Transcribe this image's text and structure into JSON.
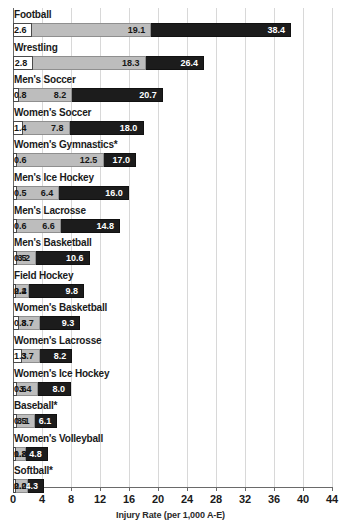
{
  "chart_data": {
    "type": "bar",
    "orientation": "horizontal",
    "title": "",
    "xlabel": "Injury Rate (per 1,000 A-E)",
    "ylabel": "",
    "xlim": [
      0,
      44
    ],
    "xticks": [
      0,
      4,
      8,
      12,
      16,
      20,
      24,
      28,
      32,
      36,
      40,
      44
    ],
    "grid": true,
    "legend": "none",
    "categories": [
      "Football",
      "Wrestling",
      "Men's Soccer",
      "Women's Soccer",
      "Women's Gymnastics*",
      "Men's Ice Hockey",
      "Men's Lacrosse",
      "Men's Basketball",
      "Field Hockey",
      "Women's Basketball",
      "Women's Lacrosse",
      "Women's Ice Hockey",
      "Baseball*",
      "Women's Volleyball",
      "Softball*"
    ],
    "series": [
      {
        "name": "white-bar",
        "color": "#ffffff",
        "values": [
          2.6,
          2.8,
          0.8,
          1.4,
          0.6,
          0.5,
          0.6,
          0.5,
          0.4,
          0.8,
          1.3,
          0.6,
          0.5,
          0.2,
          0.2
        ]
      },
      {
        "name": "gray-bar",
        "color": "#bdbdbd",
        "values": [
          19.1,
          18.3,
          8.2,
          7.8,
          12.5,
          6.4,
          6.6,
          3.2,
          2.2,
          3.7,
          3.7,
          3.4,
          3.1,
          1.8,
          2.0
        ]
      },
      {
        "name": "dark-bar",
        "color": "#1c1c1c",
        "values": [
          38.4,
          26.4,
          20.7,
          18.0,
          17.0,
          16.0,
          14.8,
          10.6,
          9.8,
          9.3,
          8.2,
          8.0,
          6.1,
          4.8,
          4.3
        ]
      }
    ]
  }
}
